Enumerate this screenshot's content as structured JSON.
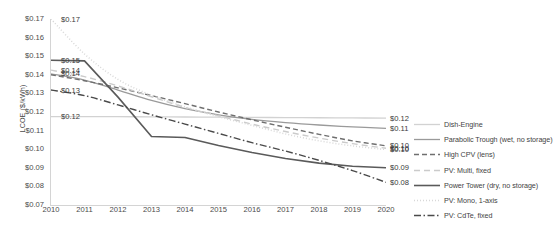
{
  "chart_data": {
    "type": "line",
    "title": "",
    "xlabel": "",
    "ylabel": "LCOE ($/kWh)",
    "x": [
      2010,
      2011,
      2012,
      2013,
      2014,
      2015,
      2016,
      2017,
      2018,
      2019,
      2020
    ],
    "xlim": [
      2010,
      2020
    ],
    "ylim": [
      0.07,
      0.17
    ],
    "ytick_labels": [
      "$0.17",
      "$0.16",
      "$0.15",
      "$0.14",
      "$0.13",
      "$0.12",
      "$0.11",
      "$0.10",
      "$0.09",
      "$0.08",
      "$0.07"
    ],
    "ytick_values": [
      0.17,
      0.16,
      0.15,
      0.14,
      0.13,
      0.12,
      0.11,
      0.1,
      0.09,
      0.08,
      0.07
    ],
    "xtick_labels": [
      "2010",
      "2011",
      "2012",
      "2013",
      "2014",
      "2015",
      "2016",
      "2017",
      "2018",
      "2019",
      "2020"
    ],
    "grid": false,
    "legend_position": "right",
    "series": [
      {
        "name": "Dish-Engine",
        "style": "solid",
        "color": "#d2d2d2",
        "width": 1.3,
        "start_label": "$0.12",
        "end_label": "$0.12",
        "values": [
          0.1175,
          0.1175,
          0.1175,
          0.1174,
          0.1173,
          0.1172,
          0.1171,
          0.117,
          0.1169,
          0.1168,
          0.1167
        ]
      },
      {
        "name": "Parabolic Trough (wet, no storage)",
        "style": "solid",
        "color": "#9a9a9a",
        "width": 1.3,
        "start_label": "$0.14",
        "end_label": "$0.11",
        "values": [
          0.1405,
          0.1372,
          0.1318,
          0.1262,
          0.1218,
          0.1185,
          0.116,
          0.1143,
          0.113,
          0.112,
          0.1112
        ]
      },
      {
        "name": "High CPV (lens)",
        "style": "dash-short",
        "color": "#6f6f6f",
        "width": 1.4,
        "start_label": "",
        "end_label": "$0.10",
        "values": [
          0.14,
          0.1368,
          0.133,
          0.1288,
          0.1245,
          0.12,
          0.1158,
          0.1118,
          0.108,
          0.1045,
          0.1018
        ]
      },
      {
        "name": "PV: Multi, fixed",
        "style": "dash-light",
        "color": "#cbcbcb",
        "width": 1.4,
        "start_label": "$0.14",
        "end_label": "$0.10",
        "values": [
          0.1425,
          0.139,
          0.134,
          0.1282,
          0.1225,
          0.118,
          0.1135,
          0.1095,
          0.106,
          0.103,
          0.1005
        ]
      },
      {
        "name": "Power Tower (dry, no storage)",
        "style": "solid",
        "color": "#5a5a5a",
        "width": 1.6,
        "start_label": "$0.15",
        "end_label": "$0.09",
        "values": [
          0.1478,
          0.1475,
          0.128,
          0.1068,
          0.1063,
          0.102,
          0.0982,
          0.095,
          0.0925,
          0.0908,
          0.09
        ]
      },
      {
        "name": "PV: Mono, 1-axis",
        "style": "dotted",
        "color": "#d8d8d8",
        "width": 1.5,
        "start_label": "$0.17",
        "end_label": "$0.10",
        "values": [
          0.17,
          0.1512,
          0.1375,
          0.129,
          0.1228,
          0.1175,
          0.1128,
          0.1082,
          0.1045,
          0.1018,
          0.0998
        ]
      },
      {
        "name": "PV: CdTe, fixed",
        "style": "dash-dot",
        "color": "#4a4a4a",
        "width": 1.4,
        "start_label": "$0.13",
        "end_label": "$0.08",
        "values": [
          0.1318,
          0.1288,
          0.1238,
          0.1185,
          0.1135,
          0.1085,
          0.1035,
          0.099,
          0.094,
          0.0885,
          0.0822
        ]
      }
    ],
    "inline_left_labels": [
      "$0.17",
      "$0.15",
      "$0.14",
      "$0.13",
      "$0.12"
    ],
    "inline_right_labels": [
      "$0.12",
      "$0.11",
      "$0.10",
      "$0.09",
      "$0.08"
    ]
  }
}
